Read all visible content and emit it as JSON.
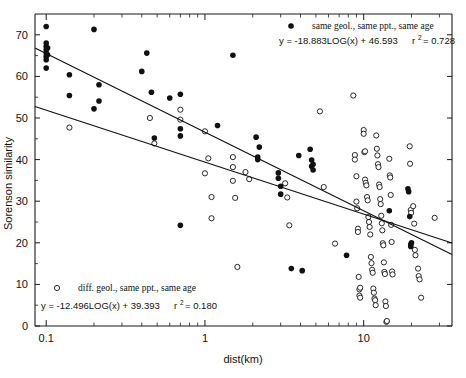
{
  "chart_data": {
    "type": "scatter",
    "title": "",
    "xlabel": "dist(km)",
    "ylabel": "Sorenson similarity",
    "xscale": "log",
    "xlim": [
      0.085,
      36
    ],
    "ylim": [
      0,
      75
    ],
    "xticks": [
      0.1,
      1,
      10
    ],
    "xtick_labels": [
      "0.1",
      "1",
      "10"
    ],
    "yticks": [
      0,
      10,
      20,
      30,
      40,
      50,
      60,
      70
    ],
    "ytick_labels": [
      "0",
      "10",
      "20",
      "30",
      "40",
      "50",
      "60",
      "70"
    ],
    "grid": false,
    "legend_position": "top-right and bottom-left",
    "series": [
      {
        "name": "same geol., same ppt., same age",
        "marker": "filled-circle",
        "color": "#111111",
        "fit_equation": "y = -18.883LOG(x) + 46.593",
        "fit_r2_label": "r",
        "fit_r2_sup": "2",
        "fit_r2_value": "= 0.728",
        "fit_slope": -18.883,
        "fit_intercept": 46.593,
        "r2": 0.728,
        "points": [
          [
            0.1,
            72.0
          ],
          [
            0.1,
            68.0
          ],
          [
            0.1,
            67.2
          ],
          [
            0.1,
            66.4
          ],
          [
            0.1,
            65.6
          ],
          [
            0.1,
            64.8
          ],
          [
            0.1,
            64.0
          ],
          [
            0.1,
            62.0
          ],
          [
            0.102,
            66.8
          ],
          [
            0.102,
            65.2
          ],
          [
            0.14,
            60.4
          ],
          [
            0.14,
            55.4
          ],
          [
            0.2,
            71.3
          ],
          [
            0.2,
            52.2
          ],
          [
            0.215,
            58.0
          ],
          [
            0.215,
            54.1
          ],
          [
            0.4,
            61.2
          ],
          [
            0.43,
            65.6
          ],
          [
            0.46,
            56.2
          ],
          [
            0.48,
            45.2
          ],
          [
            0.6,
            54.8
          ],
          [
            0.7,
            55.7
          ],
          [
            0.7,
            47.4
          ],
          [
            0.7,
            45.7
          ],
          [
            0.7,
            24.2
          ],
          [
            1.2,
            48.2
          ],
          [
            1.5,
            65.1
          ],
          [
            2.1,
            45.4
          ],
          [
            2.2,
            43.0
          ],
          [
            2.15,
            40.6
          ],
          [
            2.15,
            40.0
          ],
          [
            2.9,
            36.8
          ],
          [
            2.9,
            35.5
          ],
          [
            3.0,
            33.6
          ],
          [
            3.0,
            31.7
          ],
          [
            3.5,
            13.8
          ],
          [
            3.9,
            41.0
          ],
          [
            4.1,
            13.3
          ],
          [
            4.6,
            42.5
          ],
          [
            4.7,
            39.9
          ],
          [
            4.7,
            38.4
          ],
          [
            4.8,
            38.9
          ],
          [
            4.8,
            37.5
          ],
          [
            7.8,
            17.0
          ],
          [
            14.5,
            27.7
          ],
          [
            19.0,
            33.0
          ],
          [
            19.2,
            32.3
          ],
          [
            19.5,
            26.3
          ],
          [
            19.8,
            19.6
          ],
          [
            19.8,
            19.1
          ],
          [
            20.0,
            20.0
          ]
        ]
      },
      {
        "name": "diff. geol., same ppt., same age",
        "marker": "open-circle",
        "color": "#111111",
        "fit_equation": "y = -12.496LOG(x) + 39.393",
        "fit_r2_label": "r",
        "fit_r2_sup": "2",
        "fit_r2_value": "= 0.180",
        "fit_slope": -12.496,
        "fit_intercept": 39.393,
        "r2": 0.18,
        "points": [
          [
            0.14,
            47.7
          ],
          [
            0.45,
            50.0
          ],
          [
            0.48,
            43.9
          ],
          [
            0.7,
            52.0
          ],
          [
            0.7,
            49.6
          ],
          [
            1.0,
            46.8
          ],
          [
            1.0,
            36.7
          ],
          [
            1.05,
            40.3
          ],
          [
            1.1,
            31.0
          ],
          [
            1.1,
            25.9
          ],
          [
            1.5,
            40.6
          ],
          [
            1.5,
            38.2
          ],
          [
            1.5,
            34.9
          ],
          [
            1.55,
            30.8
          ],
          [
            1.6,
            14.2
          ],
          [
            1.8,
            37.0
          ],
          [
            1.9,
            35.3
          ],
          [
            3.2,
            34.3
          ],
          [
            3.3,
            30.9
          ],
          [
            3.4,
            24.2
          ],
          [
            5.3,
            51.6
          ],
          [
            5.6,
            33.4
          ],
          [
            6.6,
            19.8
          ],
          [
            8.6,
            55.4
          ],
          [
            8.8,
            41.1
          ],
          [
            8.8,
            40.0
          ],
          [
            9.0,
            36.0
          ],
          [
            9.0,
            29.9
          ],
          [
            9.1,
            28.3
          ],
          [
            9.2,
            23.4
          ],
          [
            9.2,
            22.6
          ],
          [
            9.3,
            11.8
          ],
          [
            9.4,
            8.8
          ],
          [
            9.4,
            7.3
          ],
          [
            9.5,
            9.2
          ],
          [
            9.5,
            6.8
          ],
          [
            10.0,
            47.1
          ],
          [
            10.0,
            46.2
          ],
          [
            10.1,
            41.8
          ],
          [
            10.2,
            42.0
          ],
          [
            10.2,
            35.2
          ],
          [
            10.3,
            34.4
          ],
          [
            10.4,
            33.8
          ],
          [
            10.5,
            31.0
          ],
          [
            10.6,
            30.2
          ],
          [
            10.7,
            26.2
          ],
          [
            10.8,
            25.0
          ],
          [
            10.9,
            23.8
          ],
          [
            11.0,
            22.0
          ],
          [
            11.1,
            16.6
          ],
          [
            11.2,
            15.1
          ],
          [
            11.3,
            13.5
          ],
          [
            11.4,
            12.8
          ],
          [
            11.5,
            9.0
          ],
          [
            11.6,
            8.0
          ],
          [
            11.7,
            6.6
          ],
          [
            11.8,
            6.2
          ],
          [
            11.9,
            5.0
          ],
          [
            12.0,
            45.8
          ],
          [
            12.1,
            42.6
          ],
          [
            12.2,
            41.0
          ],
          [
            12.3,
            38.9
          ],
          [
            12.4,
            38.2
          ],
          [
            12.5,
            34.0
          ],
          [
            12.6,
            33.4
          ],
          [
            12.7,
            30.5
          ],
          [
            12.8,
            29.3
          ],
          [
            12.9,
            26.5
          ],
          [
            13.0,
            24.7
          ],
          [
            13.1,
            23.0
          ],
          [
            13.2,
            19.9
          ],
          [
            13.3,
            19.4
          ],
          [
            13.4,
            15.3
          ],
          [
            13.5,
            13.0
          ],
          [
            13.6,
            12.5
          ],
          [
            13.7,
            5.9
          ],
          [
            13.8,
            4.8
          ],
          [
            13.9,
            1.0
          ],
          [
            14.0,
            1.2
          ],
          [
            14.5,
            40.2
          ],
          [
            14.6,
            36.2
          ],
          [
            14.7,
            35.7
          ],
          [
            14.8,
            31.5
          ],
          [
            14.9,
            24.3
          ],
          [
            15.0,
            20.2
          ],
          [
            15.1,
            13.1
          ],
          [
            15.2,
            12.4
          ],
          [
            19.5,
            43.2
          ],
          [
            19.6,
            39.0
          ],
          [
            19.8,
            27.9
          ],
          [
            19.9,
            27.2
          ],
          [
            20.5,
            28.8
          ],
          [
            20.8,
            24.6
          ],
          [
            21.0,
            18.3
          ],
          [
            21.2,
            17.0
          ],
          [
            22.0,
            13.8
          ],
          [
            22.2,
            12.0
          ],
          [
            22.5,
            11.2
          ],
          [
            23.0,
            6.8
          ],
          [
            28.0,
            26.0
          ]
        ]
      }
    ]
  },
  "legend": {
    "top": {
      "marker": "filled-circle",
      "label": "same geol., same ppt., same age",
      "equation_main": "y = -18.883LOG(x) + 46.593",
      "r_symbol": "r",
      "r_exponent": "2",
      "r_value": "= 0.728"
    },
    "bottom": {
      "marker": "open-circle",
      "label": "diff. geol., same ppt., same age",
      "equation_main": "y = -12.496LOG(x) + 39.393",
      "r_symbol": "r",
      "r_exponent": "2",
      "r_value": "= 0.180"
    }
  },
  "axes": {
    "x_title": "dist(km)",
    "y_title": "Sorenson similarity"
  }
}
